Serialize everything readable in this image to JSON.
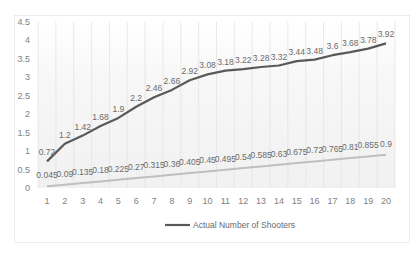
{
  "chart_data": {
    "type": "line",
    "title": "",
    "xlabel": "",
    "ylabel": "",
    "x": [
      1,
      2,
      3,
      4,
      5,
      6,
      7,
      8,
      9,
      10,
      11,
      12,
      13,
      14,
      15,
      16,
      17,
      18,
      19,
      20
    ],
    "ylim": [
      0,
      4.5
    ],
    "yticks": [
      0,
      0.5,
      1,
      1.5,
      2,
      2.5,
      3,
      3.5,
      4,
      4.5
    ],
    "ytick_labels": [
      "0",
      "0.5",
      "1",
      "1.5",
      "2",
      "2.5",
      "3",
      "3.5",
      "4",
      "4.5"
    ],
    "grid": {
      "vertical": true,
      "horizontal": false
    },
    "legend_position": "bottom",
    "series": [
      {
        "name": "Actual Number of Shooters",
        "color": "#595959",
        "show_in_legend": true,
        "values": [
          0.72,
          1.2,
          1.42,
          1.68,
          1.9,
          2.2,
          2.46,
          2.66,
          2.92,
          3.08,
          3.18,
          3.22,
          3.28,
          3.32,
          3.44,
          3.48,
          3.6,
          3.68,
          3.78,
          3.92
        ],
        "labels": [
          "0.72",
          "1.2",
          "1.42",
          "1.68",
          "1.9",
          "2.2",
          "2.46",
          "2.66",
          "2.92",
          "3.08",
          "3.18",
          "3.22",
          "3.28",
          "3.32",
          "3.44",
          "3.48",
          "3.6",
          "3.68",
          "3.78",
          "3.92"
        ]
      },
      {
        "name": "",
        "color": "#bfbfbf",
        "show_in_legend": false,
        "values": [
          0.045,
          0.09,
          0.135,
          0.18,
          0.225,
          0.27,
          0.315,
          0.36,
          0.405,
          0.45,
          0.495,
          0.54,
          0.585,
          0.63,
          0.675,
          0.72,
          0.765,
          0.81,
          0.855,
          0.9
        ],
        "labels": [
          "0.045",
          "0.09",
          "0.135",
          "0.18",
          "0.225",
          "0.27",
          "0.315",
          "0.36",
          "0.405",
          "0.45",
          "0.495",
          "0.54",
          "0.585",
          "0.63",
          "0.675",
          "0.72",
          "0.765",
          "0.81",
          "0.855",
          "0.9"
        ]
      }
    ]
  },
  "legend": {
    "items": [
      {
        "label": "Actual Number of Shooters",
        "color": "#595959"
      }
    ]
  }
}
